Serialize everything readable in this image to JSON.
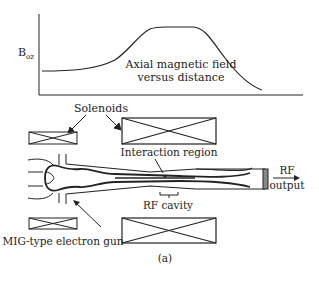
{
  "graph": {
    "y_label_main": "B",
    "y_label_sub": "oz",
    "curve_caption_line1": "Axial magnetic field",
    "curve_caption_line2": "versus distance"
  },
  "labels": {
    "solenoids": "Solenoids",
    "interaction_region": "Interaction region",
    "rf_output_line1": "RF",
    "rf_output_line2": "output",
    "rf_cavity": "RF cavity",
    "electron_gun": "MIG-type electron gun",
    "figure_caption": "(a)"
  },
  "colors": {
    "stroke": "#222222",
    "background": "#ffffff"
  }
}
